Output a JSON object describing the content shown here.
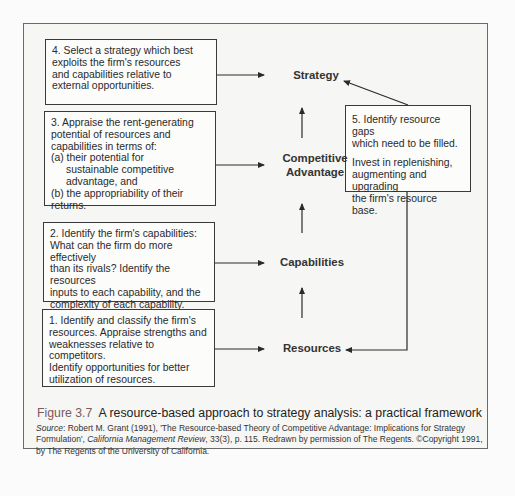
{
  "steps": {
    "step4": {
      "lines": [
        "4. Select a strategy which best",
        "exploits the firm's resources",
        "and capabilities relative to",
        "external opportunities."
      ]
    },
    "step3": {
      "lines": [
        "3. Appraise the rent-generating",
        "potential of resources and",
        "capabilities in terms of:",
        "(a) their potential for",
        "sustainable competitive",
        "advantage, and",
        "(b) the appropriability of their returns."
      ]
    },
    "step2": {
      "lines": [
        "2.  Identify the firm's capabilities:",
        "What can the firm do more effectively",
        "than its rivals?  Identify the resources",
        "inputs to each capability, and the",
        "complexity of each capability."
      ]
    },
    "step1": {
      "lines": [
        "1.  Identify and classify the firm's",
        "resources.  Appraise strengths and",
        "weaknesses relative to competitors.",
        "Identify opportunities for better",
        "utilization of resources."
      ]
    },
    "step5": {
      "heading_lines": [
        "5. Identify resource gaps",
        "which need to be filled."
      ],
      "body_lines": [
        "Invest in replenishing,",
        "augmenting and upgrading",
        "the firm's resource base."
      ]
    }
  },
  "nodes": {
    "strategy": "Strategy",
    "competitive_advantage_1": "Competitive",
    "competitive_advantage_2": "Advantage",
    "capabilities": "Capabilities",
    "resources": "Resources"
  },
  "caption": {
    "figure_number": "Figure 3.7",
    "title": "A resource-based approach to strategy analysis: a practical framework"
  },
  "source": {
    "label": "Source",
    "text1": ": Robert M. Grant (1991), 'The Resource-based Theory of Competitive Advantage: Implications for Strategy Formulation', ",
    "journal": "California Management Review",
    "text2": ", 33(3), p. 115. Redrawn by permission of The Regents. ©Copyright 1991, by The Regents of the University of California."
  }
}
